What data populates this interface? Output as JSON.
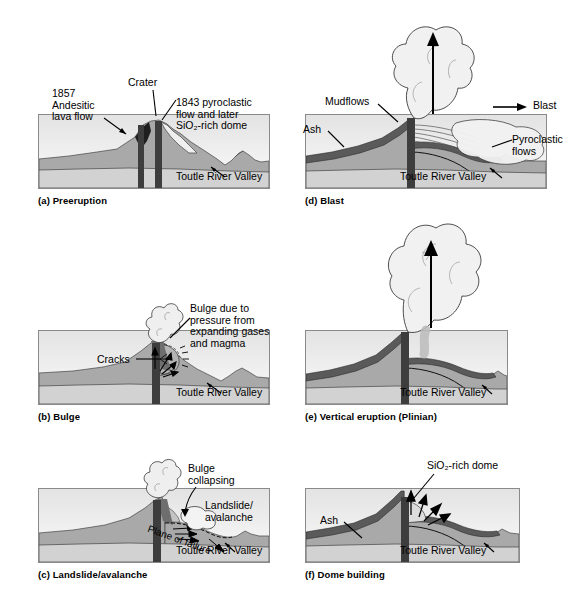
{
  "figure": {
    "common_label": "Toutle River Valley",
    "colors": {
      "sky_top": "#e4e4e4",
      "sky_bottom": "#fafafa",
      "edifice": "#a9a9a9",
      "basement": "#d2d2d2",
      "conduit": "#3d3d3d",
      "deposit_dark": "#5a5a5a",
      "cloud": "#efefef",
      "frame_border": "#8a8a8a",
      "text": "#000000"
    }
  },
  "panels": [
    {
      "id": "a",
      "caption": "(a) Preeruption",
      "labels": [
        {
          "name": "label-1857-andesitic-lava-flow",
          "text_lines": [
            "1857",
            "Andesitic",
            "lava flow"
          ]
        },
        {
          "name": "label-crater",
          "text_lines": [
            "Crater"
          ]
        },
        {
          "name": "label-1843-pyroclastic-dome",
          "text_lines": [
            "1843 pyroclastic",
            "flow and later",
            "SiO₂-rich dome"
          ]
        },
        {
          "name": "label-toutle-river-valley",
          "text_lines": [
            "Toutle River Valley"
          ]
        }
      ]
    },
    {
      "id": "b",
      "caption": "(b) Bulge",
      "labels": [
        {
          "name": "label-cracks",
          "text_lines": [
            "Cracks"
          ]
        },
        {
          "name": "label-bulge-pressure",
          "text_lines": [
            "Bulge due to",
            "pressure from",
            "expanding gases",
            "and magma"
          ]
        },
        {
          "name": "label-toutle-river-valley",
          "text_lines": [
            "Toutle River Valley"
          ]
        }
      ]
    },
    {
      "id": "c",
      "caption": "(c) Landslide/avalanche",
      "labels": [
        {
          "name": "label-bulge-collapsing",
          "text_lines": [
            "Bulge",
            "collapsing"
          ]
        },
        {
          "name": "label-landslide-avalanche",
          "text_lines": [
            "Landslide/",
            "avalanche"
          ]
        },
        {
          "name": "label-plane-of-failure",
          "text_lines": [
            "Plane of failure"
          ]
        },
        {
          "name": "label-toutle-river-valley",
          "text_lines": [
            "Toutle River Valley"
          ]
        }
      ]
    },
    {
      "id": "d",
      "caption": "(d) Blast",
      "labels": [
        {
          "name": "label-mudflows",
          "text_lines": [
            "Mudflows"
          ]
        },
        {
          "name": "label-ash",
          "text_lines": [
            "Ash"
          ]
        },
        {
          "name": "label-blast",
          "text_lines": [
            "Blast"
          ]
        },
        {
          "name": "label-pyroclastic-flows",
          "text_lines": [
            "Pyroclastic",
            "flows"
          ]
        },
        {
          "name": "label-toutle-river-valley",
          "text_lines": [
            "Toutle River Valley"
          ]
        }
      ]
    },
    {
      "id": "e",
      "caption": "(e) Vertical eruption (Plinian)",
      "labels": [
        {
          "name": "label-toutle-river-valley",
          "text_lines": [
            "Toutle River Valley"
          ]
        }
      ]
    },
    {
      "id": "f",
      "caption": "(f) Dome building",
      "labels": [
        {
          "name": "label-sio2-rich-dome",
          "text_lines": [
            "SiO₂-rich dome"
          ]
        },
        {
          "name": "label-ash",
          "text_lines": [
            "Ash"
          ]
        },
        {
          "name": "label-toutle-river-valley",
          "text_lines": [
            "Toutle River Valley"
          ]
        }
      ]
    }
  ]
}
